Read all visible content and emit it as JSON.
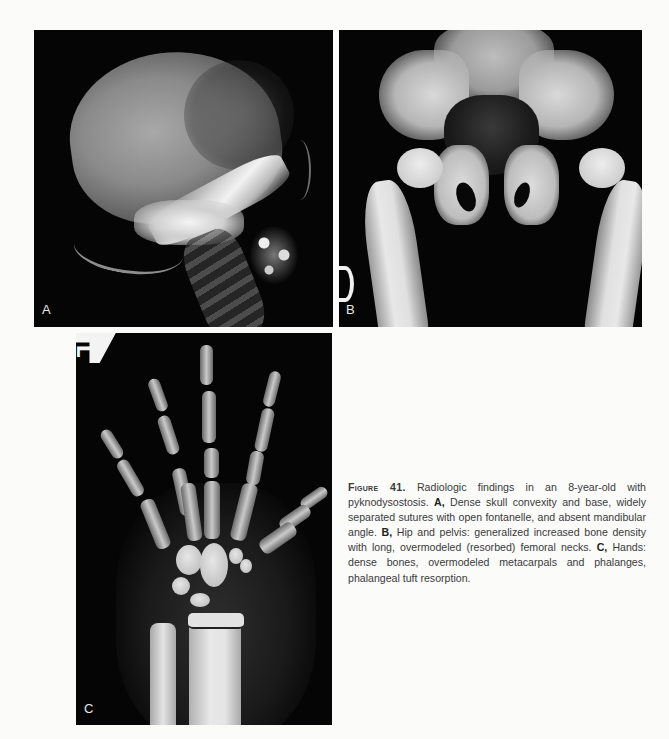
{
  "figure": {
    "panels": [
      {
        "label": "A",
        "subject": "lateral skull radiograph"
      },
      {
        "label": "B",
        "subject": "AP pelvis and hips radiograph"
      },
      {
        "label": "C",
        "subject": "PA hand and wrist radiograph"
      }
    ],
    "markers": {
      "panel_b_side_marker": "R",
      "panel_c_side_marker": "L"
    },
    "caption": {
      "figure_label": "Figure 41.",
      "intro": " Radiologic findings in an 8-year-old with pyknodysostosis. ",
      "a_label": "A,",
      "a_text": " Dense skull convexity and base, widely separated sutures with open fontanelle, and absent mandibular angle. ",
      "b_label": "B,",
      "b_text": " Hip and pelvis: generalized increased bone density with long, overmodeled (resorbed) femoral necks. ",
      "c_label": "C,",
      "c_text": " Hands: dense bones, overmodeled metacarpals and phalanges, phalangeal tuft resorption."
    }
  }
}
